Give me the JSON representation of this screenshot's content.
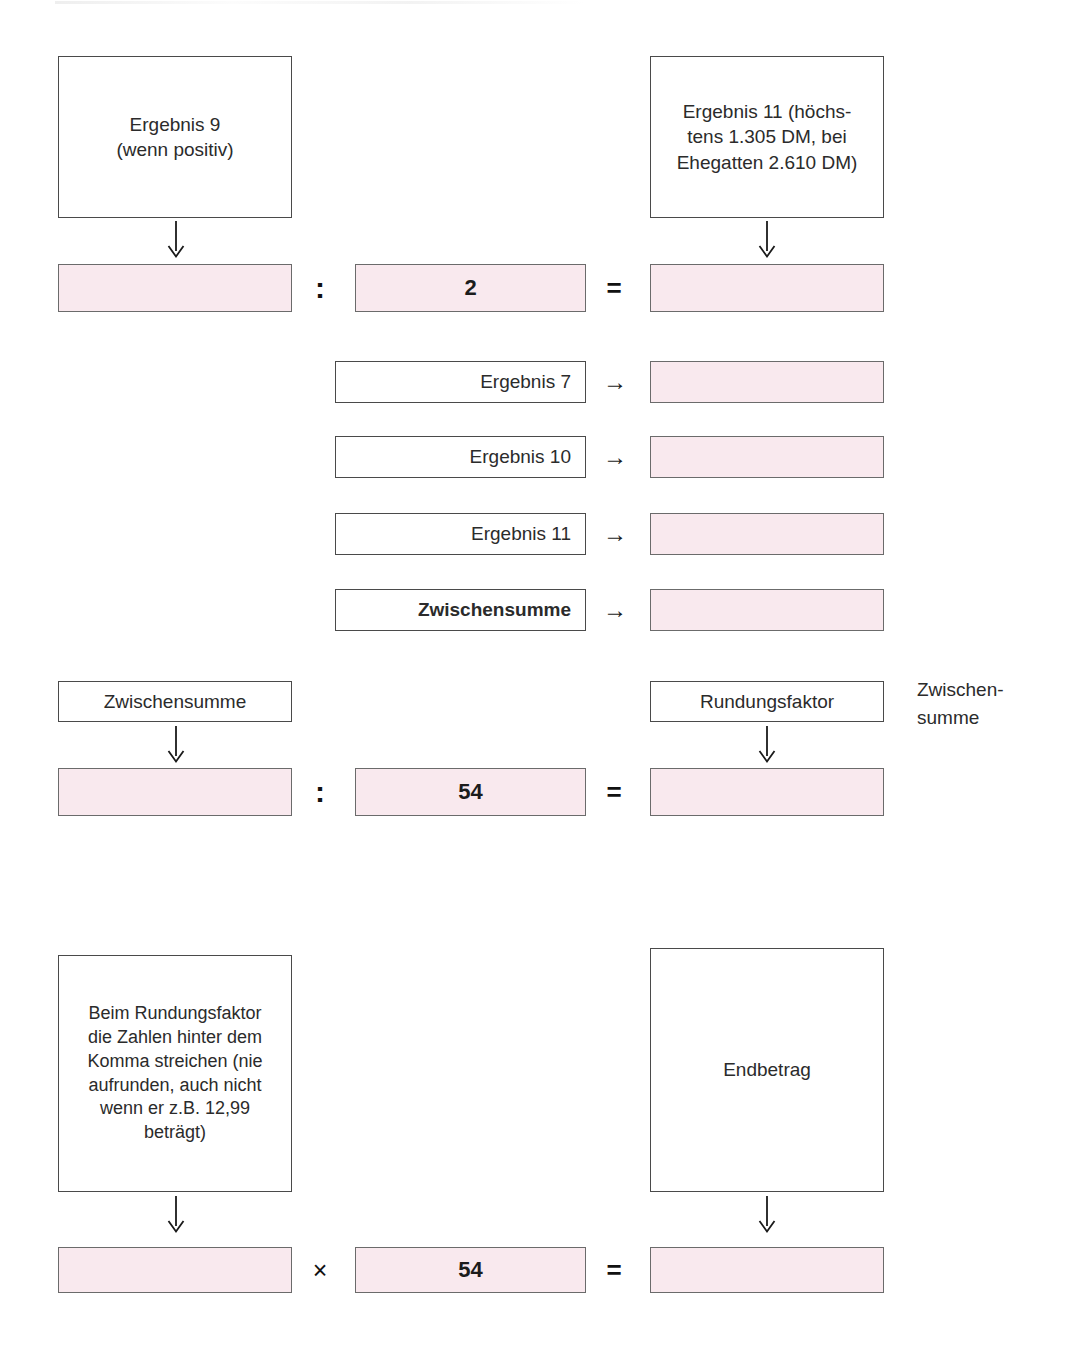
{
  "document": {
    "language": "de",
    "kind": "worksheet-calculation-flowchart",
    "colors": {
      "field_fill": "#f9e9ee",
      "field_border": "#6b6b6b",
      "box_border": "#4a4a4a",
      "text": "#2b2b2b"
    }
  },
  "section_one": {
    "source_left": {
      "line1": "Ergebnis 9",
      "line2": "(wenn positiv)"
    },
    "source_right": {
      "line1": "Ergebnis 11 (höchs-",
      "line2": "tens 1.305 DM, bei",
      "line3": "Ehegatten 2.610 DM)"
    },
    "equation": {
      "operand_left_value": "",
      "operator_1": ":",
      "divisor_value": "2",
      "operator_2": "=",
      "result_value": ""
    },
    "arrow_left": "arrow-down",
    "arrow_right": "arrow-down"
  },
  "section_two": {
    "rows": [
      {
        "label": "Ergebnis 7",
        "arrow": "→",
        "value": "",
        "bold": false
      },
      {
        "label": "Ergebnis 10",
        "arrow": "→",
        "value": "",
        "bold": false
      },
      {
        "label": "Ergebnis 11",
        "arrow": "→",
        "value": "",
        "bold": false
      },
      {
        "label": "Zwischensumme",
        "arrow": "→",
        "value": "",
        "bold": true
      }
    ]
  },
  "section_three": {
    "source_left": "Zwischensumme",
    "source_right": "Rundungsfaktor",
    "side_note": "Zwischen-\nsumme",
    "equation": {
      "operand_left_value": "",
      "operator_1": ":",
      "divisor_value": "54",
      "operator_2": "=",
      "result_value": ""
    },
    "arrow_left": "arrow-down",
    "arrow_right": "arrow-down"
  },
  "section_four": {
    "note_box": {
      "line1": "Beim Rundungsfaktor",
      "line2": "die Zahlen hinter dem",
      "line3": "Komma streichen (nie",
      "line4": "aufrunden, auch nicht",
      "line5": "wenn er z.B. 12,99",
      "line6": "beträgt)"
    },
    "result_box": "Endbetrag",
    "equation": {
      "operand_left_value": "",
      "operator_1": "×",
      "multiplier_value": "54",
      "operator_2": "=",
      "result_value": ""
    },
    "arrow_left": "arrow-down",
    "arrow_right": "arrow-down"
  }
}
